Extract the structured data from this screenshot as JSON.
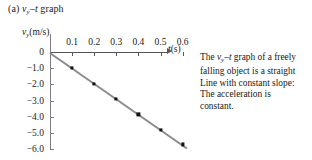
{
  "figure": {
    "label": "(a)",
    "title_prefix": "(a) ",
    "title_v": "v",
    "title_sub": "y",
    "title_dash": "–",
    "title_t": "t",
    "title_suffix": " graph"
  },
  "axes": {
    "ylabel_v": "v",
    "ylabel_sub": "y",
    "ylabel_unit": "(m/s)",
    "xlabel_t": "t",
    "xlabel_unit": "(s)"
  },
  "caption": {
    "lines": [
      "The vᵧ–t graph of a freely",
      "falling object is a straight",
      "Line with constant slope:",
      "The acceleration is",
      "constant."
    ],
    "line1_pre": "The ",
    "line1_v": "v",
    "line1_sub": "y",
    "line1_dash": "–",
    "line1_t": "t",
    "line1_post": " graph of a freely",
    "line2": "falling object is a straight",
    "line3": "Line with constant slope:",
    "line4": "The acceleration is",
    "line5": "constant."
  },
  "colors": {
    "axis": "#55555c",
    "axis_y": "#7d7d85",
    "trend_line": "#8a8a90",
    "point": "#111111",
    "background": "#ffffff",
    "text": "#1a1a1a"
  },
  "chart_data": {
    "type": "scatter",
    "xlabel": "t(s)",
    "ylabel": "v_y(m/s)",
    "xlim": [
      0,
      0.65
    ],
    "ylim": [
      -6.3,
      0.3
    ],
    "grid": false,
    "legend": null,
    "xticks": [
      0.1,
      0.2,
      0.3,
      0.4,
      0.5,
      0.6
    ],
    "xticklabels": [
      "0.1",
      "0.2",
      "0.3",
      "0.4",
      "0.5",
      "0.6"
    ],
    "yticks": [
      0,
      -1.0,
      -2.0,
      -3.0,
      -4.0,
      -5.0,
      -6.0
    ],
    "yticklabels": [
      "0",
      "−1.0",
      "−2.0",
      "−3.0",
      "−4.0",
      "−5.0",
      "−6.0"
    ],
    "x": [
      0.1,
      0.2,
      0.3,
      0.4,
      0.5,
      0.6
    ],
    "values": [
      -1.0,
      -1.95,
      -2.9,
      -3.85,
      -4.8,
      -5.7
    ],
    "series": [
      {
        "name": "freely falling object",
        "x": [
          0.1,
          0.2,
          0.3,
          0.4,
          0.5,
          0.6
        ],
        "values": [
          -1.0,
          -1.95,
          -2.9,
          -3.85,
          -4.8,
          -5.7
        ],
        "marker": "square",
        "line": "solid"
      }
    ],
    "fit_line": {
      "x": [
        0.0,
        0.62
      ],
      "y": [
        0.0,
        -5.9
      ],
      "slope": -9.5,
      "intercept": 0.0
    },
    "annotation": "The v_y–t graph of a freely falling object is a straight Line with constant slope: The acceleration is constant."
  }
}
